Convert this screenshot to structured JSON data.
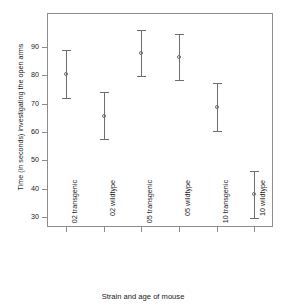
{
  "chart_data": {
    "type": "scatter",
    "title": "",
    "xlabel": "Strain and age of mouse",
    "ylabel": "Time (in seconds) investigating the open arms",
    "categories": [
      "02 transgenic",
      "02 wildtype",
      "05 transgenic",
      "05 wildtype",
      "10 transgenic",
      "10 wildtype"
    ],
    "yticks": [
      30,
      40,
      50,
      60,
      70,
      80,
      90
    ],
    "ylim": [
      26.5,
      102
    ],
    "grid": false,
    "legend": false,
    "marker": "open-circle",
    "error_bars": "vertical-with-caps",
    "series": [
      {
        "name": "mean",
        "values": [
          80.5,
          65.8,
          88.0,
          86.6,
          69.0,
          38.2
        ]
      },
      {
        "name": "lower",
        "values": [
          72.0,
          57.4,
          79.8,
          78.4,
          60.5,
          29.8
        ]
      },
      {
        "name": "upper",
        "values": [
          89.0,
          74.0,
          96.0,
          94.6,
          77.4,
          46.4
        ]
      }
    ],
    "points": [
      {
        "category": "02 transgenic",
        "mean": 80.5,
        "lower": 72.0,
        "upper": 89.0
      },
      {
        "category": "02 wildtype",
        "mean": 65.8,
        "lower": 57.4,
        "upper": 74.0
      },
      {
        "category": "05 transgenic",
        "mean": 88.0,
        "lower": 79.8,
        "upper": 96.0
      },
      {
        "category": "05 wildtype",
        "mean": 86.6,
        "lower": 78.4,
        "upper": 94.6
      },
      {
        "category": "10 transgenic",
        "mean": 69.0,
        "lower": 60.5,
        "upper": 77.4
      },
      {
        "category": "10 wildtype",
        "mean": 38.2,
        "lower": 29.8,
        "upper": 46.4
      }
    ],
    "colors": {
      "marker": "#6e6e6e",
      "error_bar": "#6e6e6e",
      "axis": "#8c8c8c",
      "text": "#1a1a1a",
      "background": "#ffffff"
    }
  }
}
